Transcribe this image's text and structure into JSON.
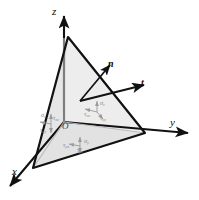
{
  "figure": {
    "type": "3d-stress-tetrahedron",
    "colors": {
      "line": "#111111",
      "face_fill": "#e8e8e8",
      "face_fill_light": "#f2f2f2",
      "stress_arrow": "#9a9a9a",
      "axis": "#111111",
      "origin_text": "#3a3a3a"
    }
  },
  "axes": [
    {
      "name": "z-axis",
      "label": "z",
      "label_x": 52,
      "label_y": 6
    },
    {
      "name": "y-axis",
      "label": "y",
      "label_x": 170,
      "label_y": 117
    },
    {
      "name": "x-axis",
      "label": "x",
      "label_x": 12,
      "label_y": 166
    }
  ],
  "origin": {
    "label": "O",
    "x": 62,
    "y": 122
  },
  "vectors": [
    {
      "name": "normal-vector",
      "label": "n",
      "label_x": 108,
      "label_y": 59
    },
    {
      "name": "traction-vector",
      "label": "t",
      "label_x": 141,
      "label_y": 78
    }
  ],
  "stress_components": {
    "z_face": [
      {
        "name": "sigma-z",
        "sym": "σ",
        "sub": "z",
        "x": 100,
        "y": 100
      },
      {
        "name": "tau-zx",
        "sym": "τ",
        "sub": "zx",
        "x": 86,
        "y": 111
      },
      {
        "name": "tau-zy",
        "sym": "τ",
        "sub": "zy",
        "x": 100,
        "y": 115
      }
    ],
    "x_face": [
      {
        "name": "sigma-x",
        "sym": "σ",
        "sub": "x",
        "x": 43,
        "y": 113
      },
      {
        "name": "tau-xz",
        "sym": "τ",
        "sub": "xz",
        "x": 53,
        "y": 115
      },
      {
        "name": "tau-xy",
        "sym": "τ",
        "sub": "xy",
        "x": 43,
        "y": 127
      }
    ],
    "y_face": [
      {
        "name": "sigma-y",
        "sym": "σ",
        "sub": "y",
        "x": 83,
        "y": 139
      },
      {
        "name": "tau-yz",
        "sym": "τ",
        "sub": "yz",
        "x": 76,
        "y": 147
      },
      {
        "name": "tau-yx",
        "sym": "τ",
        "sub": "yx",
        "x": 64,
        "y": 143
      }
    ]
  }
}
